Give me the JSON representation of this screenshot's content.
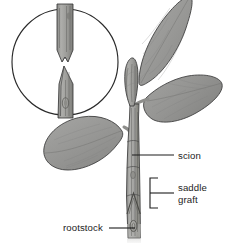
{
  "figure": {
    "title_partial": "",
    "background_color": "#ffffff",
    "ink_color": "#1c1c1c",
    "leaf_fill": "#9a9a9a",
    "leaf_fill_dark": "#8a8a88",
    "stem_fill": "#a5a5a2",
    "stem_fill_dark": "#7e7e7b"
  },
  "annotations": [
    {
      "id": "scion",
      "label": "scion",
      "x": 178,
      "y": 156,
      "type": "leader-label"
    },
    {
      "id": "saddle-graft",
      "label_line1": "saddle",
      "label_line2": "graft",
      "x": 178,
      "y": 193,
      "type": "bracket-label"
    },
    {
      "id": "rootstock",
      "label": "rootstock",
      "x": 63,
      "y": 228,
      "type": "leader-label"
    }
  ],
  "inset": {
    "name": "magnified-graft-cut-detail",
    "center_x": 65,
    "center_y": 62,
    "radius": 53,
    "parts": [
      {
        "id": "scion-notch",
        "description": "scion stem with inverted-V notch cut"
      },
      {
        "id": "rootstock-wedge",
        "description": "rootstock stem cut to a tapered wedge point"
      }
    ]
  },
  "plant": {
    "leaves": [
      {
        "id": "leaf-top",
        "position": "upper-right"
      },
      {
        "id": "leaf-right",
        "position": "mid-right"
      },
      {
        "id": "leaf-left",
        "position": "mid-left"
      }
    ],
    "stem_parts": [
      {
        "id": "shoot-tip",
        "description": "apical bud at top of scion"
      },
      {
        "id": "scion-stem",
        "description": "upper stem above graft union"
      },
      {
        "id": "graft-union",
        "description": "inverted-V saddle graft seam"
      },
      {
        "id": "rootstock-stem",
        "description": "lower stem below graft union"
      },
      {
        "id": "bud-scar",
        "description": "oval bud scar on rootstock"
      }
    ]
  }
}
